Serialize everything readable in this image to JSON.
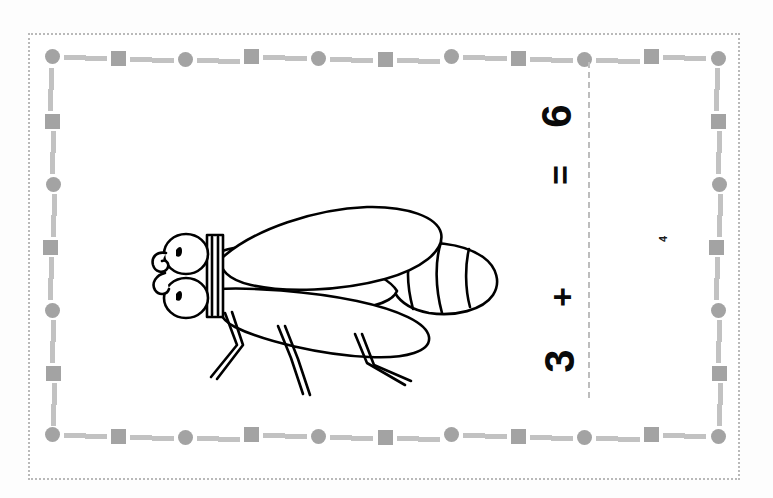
{
  "page": {
    "background_color": "#ffffff",
    "width": 773,
    "height": 498
  },
  "border": {
    "outer_frame": {
      "style": "dotted",
      "color": "#b9b9b9",
      "name": "outer-dotted-frame"
    },
    "decorative": {
      "shape_color": "#a3a3a3",
      "dash_color": "#c2c2c2",
      "pattern": [
        "circle",
        "dash",
        "dash",
        "square",
        "dash",
        "dash"
      ],
      "top_shapes": [
        "circle",
        "square",
        "circle",
        "square",
        "circle",
        "square",
        "circle",
        "square",
        "circle",
        "square",
        "circle"
      ],
      "left_shapes": [
        "circle",
        "square",
        "circle",
        "square",
        "circle",
        "square",
        "circle"
      ],
      "right_shapes": [
        "circle",
        "square",
        "circle",
        "square",
        "circle",
        "square",
        "circle"
      ],
      "bottom_shapes": [
        "circle",
        "square",
        "circle",
        "square",
        "circle",
        "square",
        "circle",
        "square",
        "circle",
        "square",
        "circle"
      ]
    }
  },
  "fold_line": {
    "name": "vertical-dashed-cut-line",
    "color": "#bdbdbd",
    "style": "dashed"
  },
  "equation": {
    "orientation": "rotated-90-ccw",
    "addend": "3",
    "plus_operator": "+",
    "equals_operator": "=",
    "answer": "6",
    "missing_addend_mark": "4",
    "full_text": "3 + _ = 6"
  },
  "illustration": {
    "name": "fly-line-drawing",
    "subject": "fly",
    "style": "black outline coloring-book line art",
    "stroke_color": "#000000",
    "fill_color": "#ffffff",
    "parts": [
      "head",
      "left-eye",
      "right-eye",
      "proboscis",
      "thorax",
      "upper-wing",
      "lower-wing",
      "abdomen",
      "abdomen-segments",
      "front-leg",
      "middle-leg",
      "hind-leg"
    ]
  },
  "colors": {
    "ink": "#0a0a0a",
    "gray_shape": "#a3a3a3",
    "gray_dash": "#c2c2c2",
    "frame": "#b9b9b9",
    "paper": "#ffffff"
  }
}
